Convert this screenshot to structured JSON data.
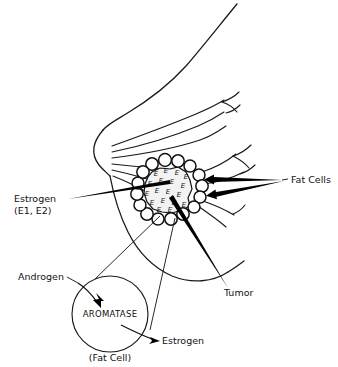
{
  "diagram": {
    "labels": {
      "fat_cells": "Fat Cells",
      "estrogen_main": "Estrogen",
      "estrogen_subscript": "(E1, E2)",
      "tumor": "Tumor",
      "androgen": "Androgen",
      "aromatase": "AROMATASE",
      "estrogen_product": "Estrogen",
      "fat_cell_note": "(Fat Cell)"
    },
    "estrogen_markers": [
      {
        "id": "e1",
        "text": "E",
        "x": 156,
        "y": 176
      },
      {
        "id": "e2",
        "text": "E",
        "x": 166,
        "y": 173
      },
      {
        "id": "e3",
        "text": "E",
        "x": 177,
        "y": 175
      },
      {
        "id": "e4",
        "text": "E",
        "x": 186,
        "y": 179
      },
      {
        "id": "e5",
        "text": "E",
        "x": 150,
        "y": 186
      },
      {
        "id": "e6",
        "text": "E",
        "x": 161,
        "y": 183
      },
      {
        "id": "e7",
        "text": "E",
        "x": 172,
        "y": 184
      },
      {
        "id": "e8",
        "text": "E",
        "x": 183,
        "y": 188
      },
      {
        "id": "e9",
        "text": "E",
        "x": 147,
        "y": 196
      },
      {
        "id": "e10",
        "text": "E",
        "x": 157,
        "y": 193
      },
      {
        "id": "e11",
        "text": "E",
        "x": 168,
        "y": 194
      },
      {
        "id": "e12",
        "text": "E",
        "x": 179,
        "y": 197
      },
      {
        "id": "e13",
        "text": "E",
        "x": 152,
        "y": 205
      },
      {
        "id": "e14",
        "text": "E",
        "x": 163,
        "y": 203
      },
      {
        "id": "e15",
        "text": "E",
        "x": 174,
        "y": 205
      },
      {
        "id": "e16",
        "text": "E",
        "x": 159,
        "y": 212
      },
      {
        "id": "e17",
        "text": "E",
        "x": 170,
        "y": 212
      },
      {
        "id": "e18",
        "text": "E",
        "x": 184,
        "y": 207
      }
    ],
    "fat_cell_ring": [
      {
        "cx": 152,
        "cy": 164,
        "r": 6.2
      },
      {
        "cx": 165,
        "cy": 160,
        "r": 6.4
      },
      {
        "cx": 178,
        "cy": 161,
        "r": 6.2
      },
      {
        "cx": 190,
        "cy": 166,
        "r": 6.0
      },
      {
        "cx": 199,
        "cy": 175,
        "r": 6.0
      },
      {
        "cx": 202,
        "cy": 186,
        "r": 6.2
      },
      {
        "cx": 200,
        "cy": 197,
        "r": 6.0
      },
      {
        "cx": 194,
        "cy": 207,
        "r": 6.0
      },
      {
        "cx": 183,
        "cy": 214,
        "r": 6.2
      },
      {
        "cx": 171,
        "cy": 219,
        "r": 6.2
      },
      {
        "cx": 158,
        "cy": 219,
        "r": 6.0
      },
      {
        "cx": 147,
        "cy": 214,
        "r": 6.2
      },
      {
        "cx": 140,
        "cy": 205,
        "r": 6.0
      },
      {
        "cx": 137,
        "cy": 194,
        "r": 6.2
      },
      {
        "cx": 138,
        "cy": 183,
        "r": 6.0
      },
      {
        "cx": 143,
        "cy": 172,
        "r": 6.2
      }
    ],
    "colors": {
      "ink": "#111111",
      "line": "#1a1a1a",
      "background": "#ffffff",
      "tumor_fill": "#f2f2f2"
    }
  }
}
